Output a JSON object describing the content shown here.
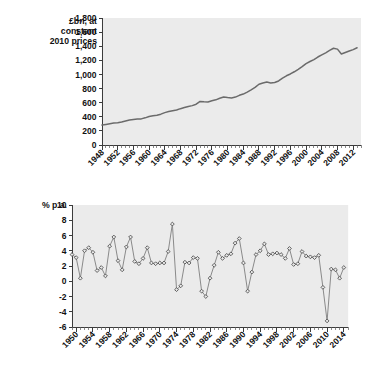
{
  "chart_data": [
    {
      "id": "gdp-level",
      "type": "line",
      "title": "",
      "ylabel": "£bn, at constant 2010 prices",
      "ylabel_lines": [
        "£bn, at",
        "constant",
        "2010 prices"
      ],
      "xlabel": "",
      "ylim": [
        0,
        1800
      ],
      "ytick_step": 200,
      "ytick_labels": [
        "0",
        "200",
        "400",
        "600",
        "800",
        "1,000",
        "1,200",
        "1,400",
        "1,600",
        "1,800"
      ],
      "ytick_values": [
        0,
        200,
        400,
        600,
        800,
        1000,
        1200,
        1400,
        1600,
        1800
      ],
      "xlim": [
        1948,
        2014
      ],
      "xtick_labels": [
        "1948",
        "1952",
        "1956",
        "1960",
        "1964",
        "1968",
        "1972",
        "1976",
        "1980",
        "1984",
        "1988",
        "1992",
        "1996",
        "2000",
        "2004",
        "2008",
        "2012"
      ],
      "xtick_values": [
        1948,
        1952,
        1956,
        1960,
        1964,
        1968,
        1972,
        1976,
        1980,
        1984,
        1988,
        1992,
        1996,
        2000,
        2004,
        2008,
        2012
      ],
      "xtick_minor_step": 1,
      "grid": false,
      "legend": "none",
      "markers": false,
      "x": [
        1948,
        1949,
        1950,
        1951,
        1952,
        1953,
        1954,
        1955,
        1956,
        1957,
        1958,
        1959,
        1960,
        1961,
        1962,
        1963,
        1964,
        1965,
        1966,
        1967,
        1968,
        1969,
        1970,
        1971,
        1972,
        1973,
        1974,
        1975,
        1976,
        1977,
        1978,
        1979,
        1980,
        1981,
        1982,
        1983,
        1984,
        1985,
        1986,
        1987,
        1988,
        1989,
        1990,
        1991,
        1992,
        1993,
        1994,
        1995,
        1996,
        1997,
        1998,
        1999,
        2000,
        2001,
        2002,
        2003,
        2004,
        2005,
        2006,
        2007,
        2008,
        2009,
        2010,
        2011,
        2012,
        2013
      ],
      "values": [
        283,
        292,
        302,
        311,
        314,
        326,
        340,
        354,
        361,
        368,
        370,
        385,
        403,
        415,
        422,
        437,
        459,
        474,
        486,
        495,
        515,
        531,
        546,
        558,
        578,
        618,
        613,
        610,
        627,
        640,
        663,
        680,
        672,
        667,
        679,
        704,
        722,
        750,
        782,
        816,
        861,
        879,
        892,
        880,
        885,
        908,
        948,
        981,
        1007,
        1038,
        1073,
        1110,
        1153,
        1183,
        1211,
        1247,
        1278,
        1306,
        1340,
        1371,
        1359,
        1289,
        1311,
        1332,
        1352,
        1378
      ]
    },
    {
      "id": "gdp-growth",
      "type": "line",
      "title": "",
      "ylabel": "% p.a.",
      "ylabel_lines": [
        "% p.a."
      ],
      "xlabel": "",
      "ylim": [
        -6,
        10
      ],
      "ytick_step": 2,
      "ytick_labels": [
        "-6",
        "-4",
        "-2",
        "0",
        "2",
        "4",
        "6",
        "8",
        "10"
      ],
      "ytick_values": [
        -6,
        -4,
        -2,
        0,
        2,
        4,
        6,
        8,
        10
      ],
      "xlim": [
        1949,
        2015
      ],
      "xtick_labels": [
        "1950",
        "1954",
        "1958",
        "1962",
        "1966",
        "1970",
        "1974",
        "1978",
        "1982",
        "1986",
        "1990",
        "1994",
        "1998",
        "2002",
        "2006",
        "2010",
        "2014"
      ],
      "xtick_values": [
        1950,
        1954,
        1958,
        1962,
        1966,
        1970,
        1974,
        1978,
        1982,
        1986,
        1990,
        1994,
        1998,
        2002,
        2006,
        2010,
        2014
      ],
      "xtick_minor_step": 1,
      "grid": false,
      "legend": "none",
      "markers": true,
      "x": [
        1949,
        1950,
        1951,
        1952,
        1953,
        1954,
        1955,
        1956,
        1957,
        1958,
        1959,
        1960,
        1961,
        1962,
        1963,
        1964,
        1965,
        1966,
        1967,
        1968,
        1969,
        1970,
        1971,
        1972,
        1973,
        1974,
        1975,
        1976,
        1977,
        1978,
        1979,
        1980,
        1981,
        1982,
        1983,
        1984,
        1985,
        1986,
        1987,
        1988,
        1989,
        1990,
        1991,
        1992,
        1993,
        1994,
        1995,
        1996,
        1997,
        1998,
        1999,
        2000,
        2001,
        2002,
        2003,
        2004,
        2005,
        2006,
        2007,
        2008,
        2009,
        2010,
        2011,
        2012,
        2013,
        2014
      ],
      "values": [
        3.5,
        3.1,
        0.4,
        4.0,
        4.4,
        3.8,
        1.4,
        1.8,
        0.7,
        4.6,
        5.8,
        2.7,
        1.5,
        4.5,
        5.8,
        2.6,
        2.3,
        3.0,
        4.4,
        2.4,
        2.3,
        2.4,
        2.4,
        3.9,
        7.5,
        -1.1,
        -0.6,
        2.5,
        2.4,
        3.1,
        3.0,
        -1.3,
        -2.0,
        0.4,
        2.1,
        3.8,
        3.0,
        3.4,
        3.6,
        5.0,
        5.6,
        2.4,
        -1.3,
        1.2,
        3.5,
        4.0,
        4.9,
        3.5,
        3.6,
        3.7,
        3.5,
        3.0,
        4.3,
        2.2,
        2.3,
        3.9,
        3.3,
        3.2,
        3.1,
        3.4,
        -0.8,
        -5.2,
        1.6,
        1.5,
        0.4,
        1.8
      ]
    }
  ],
  "figures": [
    {
      "name": "gdp-level-figure",
      "caption": ""
    },
    {
      "name": "gdp-growth-figure",
      "caption": ""
    }
  ]
}
